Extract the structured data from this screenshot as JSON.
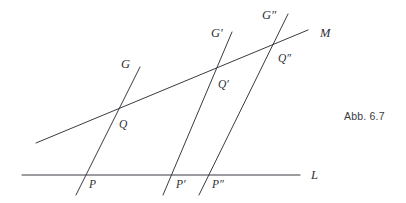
{
  "figure": {
    "caption": "Abb. 6.7",
    "caption_position": {
      "x": 344,
      "y": 110
    },
    "stroke_color": "#3a3a42",
    "text_color": "#2e2e36",
    "background_color": "#ffffff",
    "width": 406,
    "height": 203
  },
  "chart_data": {
    "type": "diagram",
    "title": "Abb. 6.7",
    "lines": [
      {
        "name": "L",
        "label": "L",
        "label_x": 311,
        "label_y": 179,
        "x1": 22,
        "y1": 175,
        "x2": 300,
        "y2": 175
      },
      {
        "name": "M",
        "label": "M",
        "label_x": 320,
        "label_y": 37,
        "x1": 36,
        "y1": 143,
        "x2": 308,
        "y2": 30
      },
      {
        "name": "G",
        "label": "G",
        "label_x": 121,
        "label_y": 68,
        "x1": 76,
        "y1": 195,
        "x2": 140,
        "y2": 67
      },
      {
        "name": "G'",
        "label": "G′",
        "label_x": 211,
        "label_y": 37,
        "x1": 163,
        "y1": 195,
        "x2": 232,
        "y2": 32
      },
      {
        "name": "G''",
        "label": "G″",
        "label_x": 262,
        "label_y": 19,
        "x1": 199,
        "y1": 195,
        "x2": 288,
        "y2": 14
      }
    ],
    "points": [
      {
        "name": "P",
        "label": "P",
        "x": 82,
        "y": 175,
        "label_x": 89,
        "label_y": 188,
        "on_lines": [
          "L",
          "G"
        ]
      },
      {
        "name": "P'",
        "label": "P′",
        "x": 170,
        "y": 175,
        "label_x": 176,
        "label_y": 188,
        "on_lines": [
          "L",
          "G'"
        ]
      },
      {
        "name": "P''",
        "label": "P″",
        "x": 205,
        "y": 175,
        "label_x": 212,
        "label_y": 188,
        "on_lines": [
          "L",
          "G''"
        ]
      },
      {
        "name": "Q",
        "label": "Q",
        "x": 113,
        "y": 112,
        "label_x": 119,
        "label_y": 128,
        "on_lines": [
          "M",
          "G"
        ]
      },
      {
        "name": "Q'",
        "label": "Q′",
        "x": 213,
        "y": 72,
        "label_x": 218,
        "label_y": 88,
        "on_lines": [
          "M",
          "G'"
        ]
      },
      {
        "name": "Q''",
        "label": "Q″",
        "x": 272,
        "y": 48,
        "label_x": 278,
        "label_y": 62,
        "on_lines": [
          "M",
          "G''"
        ]
      }
    ]
  }
}
